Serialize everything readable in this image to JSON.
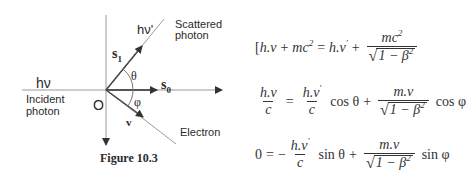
{
  "figure": {
    "caption": "Figure 10.3",
    "labels": {
      "incident_energy": "hν",
      "incident_caption_1": "Incident",
      "incident_caption_2": "photon",
      "origin": "O",
      "scattered_energy": "hν'",
      "scattered_caption_1": "Scattered",
      "scattered_caption_2": "photon",
      "s1": "s",
      "s1_sub": "1",
      "s0": "s",
      "s0_sub": "0",
      "theta": "θ",
      "phi": "φ",
      "velocity": "v",
      "electron": "Electron"
    },
    "colors": {
      "line": "#999999",
      "arrow": "#333333"
    }
  },
  "equations": {
    "eq1": {
      "bracket": "[",
      "lhs_a": "h.v",
      "plus1": "+",
      "lhs_b": "mc",
      "lhs_b_exp": "2",
      "equals": "=",
      "rhs_a": "h.v",
      "rhs_a_prime": "'",
      "plus2": "+",
      "frac_num": "mc",
      "frac_num_exp": "2",
      "sqrt_body": "1 − β",
      "sqrt_exp": "2"
    },
    "eq2": {
      "lhs_num": "h.v",
      "lhs_den": "c",
      "equals": "=",
      "t1_num": "h.v",
      "t1_prime": "'",
      "t1_den": "c",
      "t1_fn": "cos θ",
      "plus": "+",
      "t2_num": "m.v",
      "sqrt_body": "1 − β",
      "sqrt_exp": "2",
      "t2_fn": "cos φ"
    },
    "eq3": {
      "lhs": "0",
      "equals": "=",
      "minus": "−",
      "t1_num": "h.v",
      "t1_prime": "'",
      "t1_den": "c",
      "t1_fn": "sin θ",
      "plus": "+",
      "t2_num": "m.v",
      "sqrt_body": "1 − β",
      "sqrt_exp": "2",
      "t2_fn": "sin φ"
    }
  }
}
